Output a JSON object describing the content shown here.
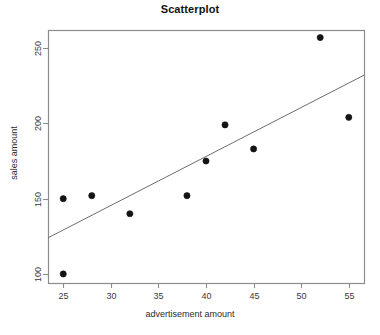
{
  "chart_data": {
    "type": "scatter",
    "title": "Scatterplot",
    "xlabel": "advertisement amount",
    "ylabel": "sales amount",
    "xlim": [
      23.4,
      56.6
    ],
    "ylim": [
      94,
      262
    ],
    "grid": false,
    "legend": "none",
    "xticks": [
      25,
      30,
      35,
      40,
      45,
      50,
      55
    ],
    "yticks": [
      100,
      150,
      200,
      250
    ],
    "xtick_labels": [
      "25",
      "30",
      "35",
      "40",
      "45",
      "50",
      "55"
    ],
    "ytick_labels": [
      "100",
      "150",
      "200",
      "250"
    ],
    "points": [
      {
        "x": 25,
        "y": 150
      },
      {
        "x": 25,
        "y": 100
      },
      {
        "x": 28,
        "y": 152
      },
      {
        "x": 32,
        "y": 140
      },
      {
        "x": 38,
        "y": 152
      },
      {
        "x": 40,
        "y": 175
      },
      {
        "x": 42,
        "y": 199
      },
      {
        "x": 45,
        "y": 183
      },
      {
        "x": 52,
        "y": 257
      },
      {
        "x": 55,
        "y": 204
      }
    ],
    "trendline": {
      "name": "regression line",
      "x": [
        23.4,
        56.6
      ],
      "y": [
        124,
        232
      ]
    },
    "marker": {
      "shape": "filled-circle",
      "color": "#141414",
      "size": 3.1
    },
    "line_color": "#6e6e6e",
    "axis_color": "#8c8c8c"
  }
}
